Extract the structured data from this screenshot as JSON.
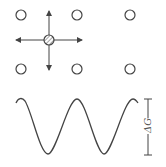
{
  "diagram": {
    "lattice": {
      "sites": [
        {
          "x": 21,
          "y": 15,
          "type": "empty"
        },
        {
          "x": 77,
          "y": 15,
          "type": "empty"
        },
        {
          "x": 130,
          "y": 15,
          "type": "empty"
        },
        {
          "x": 21,
          "y": 69,
          "type": "empty"
        },
        {
          "x": 77,
          "y": 69,
          "type": "empty"
        },
        {
          "x": 130,
          "y": 69,
          "type": "empty"
        }
      ],
      "interstitial": {
        "x": 49,
        "y": 40,
        "type": "hatched-atom"
      },
      "arrows": [
        "left",
        "right",
        "up",
        "down"
      ]
    },
    "energy_profile": {
      "curve": "sinusoidal",
      "peaks": 3,
      "troughs": 2,
      "barrier_label": "ΔG"
    },
    "colors": {
      "stroke": "#444444",
      "background": "#ffffff"
    }
  }
}
